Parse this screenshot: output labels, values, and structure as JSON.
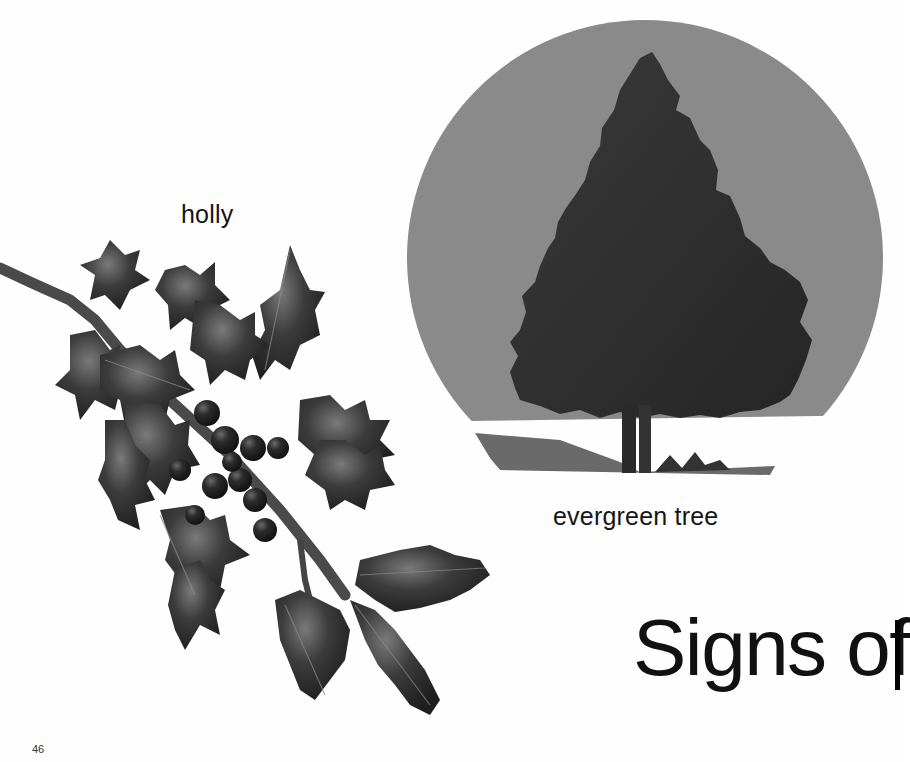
{
  "page": {
    "number": "46",
    "heading": "Signs of",
    "captions": {
      "holly": "holly",
      "tree": "evergreen tree"
    }
  },
  "illustrations": [
    {
      "id": "holly",
      "description": "holly sprig with spiky leaves and cluster of berries"
    },
    {
      "id": "evergreen-tree",
      "description": "evergreen tree in snow inside a circular sky frame"
    }
  ],
  "colors": {
    "background": "#fefefe",
    "sky": "#8a8a8a",
    "foliage": "#2e2e2e",
    "leaf": "#3a3a3a",
    "berry": "#262626",
    "shadow": "#6a6a6a",
    "text": "#111111"
  }
}
